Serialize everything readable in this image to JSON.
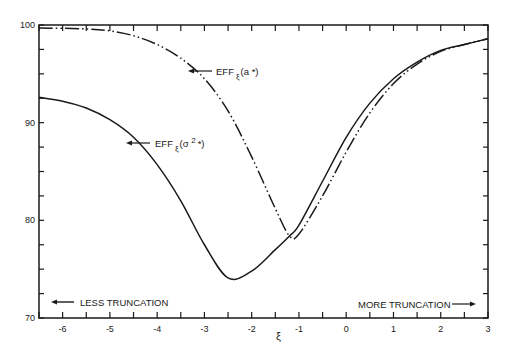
{
  "chart_data": {
    "type": "line",
    "title": "",
    "xlabel": "ξ",
    "ylabel": "",
    "xlim": [
      -6.5,
      3
    ],
    "ylim": [
      70,
      100
    ],
    "grid": false,
    "x_ticks": [
      "-6",
      "-5",
      "-4",
      "-3",
      "-2",
      "-1",
      "0",
      "1",
      "2",
      "3"
    ],
    "y_ticks": [
      "70",
      "80",
      "90",
      "100"
    ],
    "series": [
      {
        "name": "EFF_ξ(a*)",
        "style": "dash-dot-dot",
        "x": [
          -6.5,
          -5.5,
          -5.0,
          -4.5,
          -4.0,
          -3.5,
          -3.0,
          -2.5,
          -2.0,
          -1.5,
          -1.2,
          -1.0,
          -0.5,
          0.0,
          0.5,
          1.0,
          1.5,
          2.0,
          2.5,
          3.0
        ],
        "y": [
          99.7,
          99.6,
          99.4,
          98.9,
          98.0,
          96.6,
          94.5,
          91.2,
          86.5,
          81.2,
          78.4,
          78.6,
          82.5,
          87.0,
          91.0,
          94.0,
          96.0,
          97.3,
          98.0,
          98.6
        ]
      },
      {
        "name": "EFF_ξ(σ²*)",
        "style": "solid",
        "x": [
          -6.5,
          -6.0,
          -5.5,
          -5.0,
          -4.5,
          -4.0,
          -3.5,
          -3.0,
          -2.5,
          -2.0,
          -1.5,
          -1.2,
          -1.0,
          -0.5,
          0.0,
          0.5,
          1.0,
          1.5,
          2.0,
          2.5,
          3.0
        ],
        "y": [
          92.6,
          92.2,
          91.5,
          90.3,
          88.5,
          85.7,
          82.0,
          77.5,
          74.1,
          74.8,
          77.0,
          78.4,
          79.5,
          84.0,
          88.5,
          92.0,
          94.5,
          96.2,
          97.4,
          98.0,
          98.6
        ]
      }
    ],
    "annotations": [
      {
        "text": "EFF",
        "subscript": "ξ",
        "suffix": "(a *)",
        "x": -3.0,
        "y": 95.3
      },
      {
        "text": "EFF",
        "subscript": "ξ",
        "suffix": "(σ 2 *)",
        "x": -4.6,
        "y": 88.2
      },
      {
        "text": "LESS TRUNCATION",
        "arrow": "left"
      },
      {
        "text": "MORE TRUNCATION",
        "arrow": "right"
      }
    ]
  },
  "labels": {
    "curve_a": {
      "main": "EFF",
      "sub": "ξ",
      "tail": "(a *)"
    },
    "curve_sigma": {
      "main": "EFF",
      "sub": "ξ",
      "tail": "(σ ",
      "sup": "2",
      "end": "*)"
    },
    "less_truncation": "LESS TRUNCATION",
    "more_truncation": "MORE TRUNCATION",
    "xi_symbol": "ξ"
  }
}
